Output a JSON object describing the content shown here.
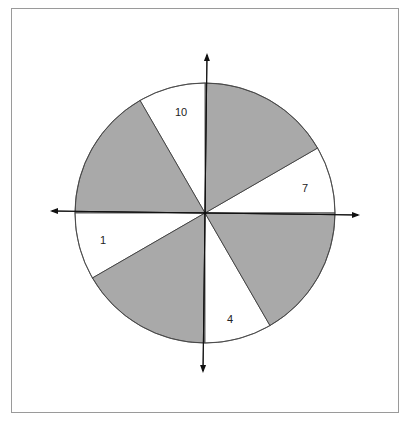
{
  "diagram": {
    "type": "spinner",
    "center": [
      205,
      213
    ],
    "radius": 130,
    "colors": {
      "shaded": "#a9a9a9",
      "unshaded": "#ffffff",
      "stroke": "#333333"
    },
    "sectors": [
      {
        "start_deg": 0,
        "end_deg": 30,
        "shaded": false,
        "label": "7"
      },
      {
        "start_deg": 30,
        "end_deg": 90,
        "shaded": true,
        "label": ""
      },
      {
        "start_deg": 90,
        "end_deg": 120,
        "shaded": false,
        "label": "10"
      },
      {
        "start_deg": 120,
        "end_deg": 180,
        "shaded": true,
        "label": ""
      },
      {
        "start_deg": 180,
        "end_deg": 210,
        "shaded": false,
        "label": "1"
      },
      {
        "start_deg": 210,
        "end_deg": 270,
        "shaded": true,
        "label": ""
      },
      {
        "start_deg": 270,
        "end_deg": 300,
        "shaded": false,
        "label": "4"
      },
      {
        "start_deg": 300,
        "end_deg": 360,
        "shaded": true,
        "label": ""
      }
    ],
    "labels": {
      "l7": "7",
      "l10": "10",
      "l1": "1",
      "l4": "4"
    }
  }
}
